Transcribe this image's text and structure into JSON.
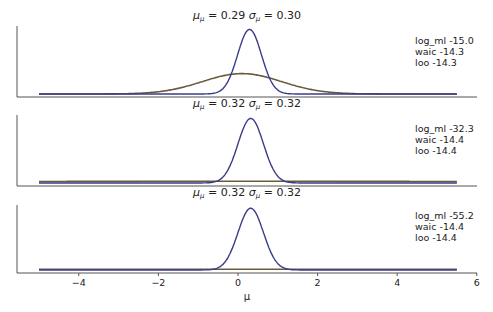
{
  "chart_data": {
    "type": "line",
    "layout": "3 stacked panels sharing x-axis",
    "xlabel": "μ",
    "xlim": [
      -5,
      6
    ],
    "xticks": [
      -4,
      -2,
      0,
      2,
      4,
      6
    ],
    "xtick_labels": [
      "−4",
      "−2",
      "0",
      "2",
      "4",
      "6"
    ],
    "grid": false,
    "panels": [
      {
        "title_mu": "0.29",
        "title_sigma": "0.30",
        "annotations": [
          "log_ml -15.0",
          "waic -14.3",
          "loo -14.3"
        ],
        "series": [
          {
            "name": "posterior",
            "color": "#3b3b8c",
            "type": "normal",
            "mean": 0.29,
            "sd": 0.3,
            "peak_frac": 0.95
          },
          {
            "name": "prior",
            "color": "#6b5a3a",
            "type": "normal",
            "mean": 0.1,
            "sd": 1.0,
            "peak_frac": 0.3
          }
        ]
      },
      {
        "title_mu": "0.32",
        "title_sigma": "0.32",
        "annotations": [
          "log_ml -32.3",
          "waic -14.4",
          "loo -14.4"
        ],
        "series": [
          {
            "name": "posterior",
            "color": "#3b3b8c",
            "type": "normal",
            "mean": 0.32,
            "sd": 0.32,
            "peak_frac": 0.95
          },
          {
            "name": "prior",
            "color": "#6b5a3a",
            "type": "normal",
            "mean": 0.0,
            "sd": 10.0,
            "peak_frac": 0.025
          }
        ]
      },
      {
        "title_mu": "0.32",
        "title_sigma": "0.32",
        "annotations": [
          "log_ml -55.2",
          "waic -14.4",
          "loo -14.4"
        ],
        "series": [
          {
            "name": "posterior",
            "color": "#3b3b8c",
            "type": "normal",
            "mean": 0.32,
            "sd": 0.32,
            "peak_frac": 0.95
          },
          {
            "name": "prior",
            "color": "#6b5a3a",
            "type": "normal",
            "mean": 0.0,
            "sd": 100.0,
            "peak_frac": 0.012
          }
        ]
      }
    ],
    "colors": {
      "posterior": "#3b3b8c",
      "prior": "#6b5a3a",
      "axis": "#555555"
    }
  }
}
